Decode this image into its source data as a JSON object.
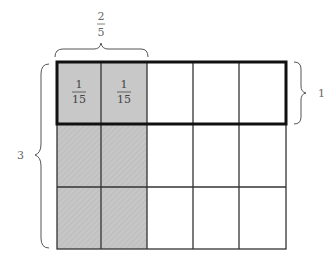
{
  "diagram": {
    "grid": {
      "rows": 3,
      "cols": 5,
      "shaded_cols": 2,
      "highlighted_row": 0
    },
    "labels": {
      "top_fraction_numerator": "2",
      "top_fraction_denominator": "5",
      "right_label": "1",
      "left_label": "3",
      "cell_numerator": "1",
      "cell_denominator": "15"
    },
    "colors": {
      "shade": "#c4c4c4",
      "grid_line": "#333333",
      "highlight_border": "#111111",
      "brace": "#555555"
    }
  }
}
